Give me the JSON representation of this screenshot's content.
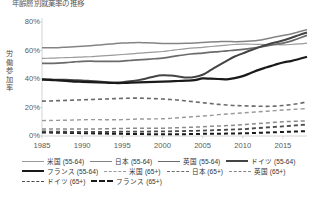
{
  "title": "年齢層別就業率の推移",
  "axes": {
    "ylabel": "労働参加率",
    "yticks": [
      "80%",
      "60%",
      "40%",
      "20%",
      "0%"
    ],
    "xticks": [
      "1985",
      "1990",
      "1995",
      "2000",
      "2005",
      "2010",
      "2015"
    ]
  },
  "legend": [
    {
      "label": "米国 (55-64)",
      "color": "#9a9a9a",
      "width": 1.2,
      "dash": "none"
    },
    {
      "label": "日本 (55-64)",
      "color": "#848484",
      "width": 1.5,
      "dash": "none"
    },
    {
      "label": "英国 (55-64)",
      "color": "#6b6b6b",
      "width": 1.7,
      "dash": "none"
    },
    {
      "label": "ドイツ (55-64)",
      "color": "#444444",
      "width": 2.0,
      "dash": "none"
    },
    {
      "label": "フランス (55-64)",
      "color": "#1a1a1a",
      "width": 2.2,
      "dash": "none"
    },
    {
      "label": "米国 (65+)",
      "color": "#9a9a9a",
      "width": 1.4,
      "dash": "4,3"
    },
    {
      "label": "日本 (65+)",
      "color": "#6b6b6b",
      "width": 1.6,
      "dash": "4,3"
    },
    {
      "label": "英国 (65+)",
      "color": "#8a8a8a",
      "width": 1.5,
      "dash": "4,3"
    },
    {
      "label": "ドイツ (65+)",
      "color": "#4a4a4a",
      "width": 1.8,
      "dash": "4,3"
    },
    {
      "label": "フランス (65+)",
      "color": "#1a1a1a",
      "width": 2.0,
      "dash": "4,3"
    }
  ],
  "chart_data": {
    "type": "line",
    "title": "年齢層別就業率の推移",
    "xlabel": "",
    "ylabel": "労働参加率",
    "ylim": [
      0,
      80
    ],
    "xlim": [
      1985,
      2018
    ],
    "grid": false,
    "legend_position": "bottom",
    "x": [
      1985,
      1986,
      1987,
      1988,
      1989,
      1990,
      1991,
      1992,
      1993,
      1994,
      1995,
      1996,
      1997,
      1998,
      1999,
      2000,
      2001,
      2002,
      2003,
      2004,
      2005,
      2006,
      2007,
      2008,
      2009,
      2010,
      2011,
      2012,
      2013,
      2014,
      2015,
      2016,
      2017,
      2018
    ],
    "series": [
      {
        "name": "日本 (55-64)",
        "color": "#848484",
        "dash": "none",
        "values": [
          62,
          62,
          62,
          62.3,
          62.6,
          63,
          63.4,
          63.8,
          64.3,
          64.8,
          65.2,
          65.4,
          65.6,
          65.4,
          65.2,
          65,
          65,
          65,
          65.1,
          65.3,
          65.6,
          65.9,
          66.2,
          66.4,
          66.2,
          66.3,
          66.6,
          67.2,
          68.3,
          69.4,
          70.5,
          71.6,
          73.2,
          74.6
        ]
      },
      {
        "name": "米国 (55-64)",
        "color": "#9a9a9a",
        "dash": "none",
        "values": [
          54.5,
          54.6,
          54.8,
          55,
          55.2,
          55.4,
          55.6,
          56,
          56.4,
          56.8,
          57.2,
          57.6,
          58.1,
          58.5,
          58.9,
          59.3,
          60,
          60.7,
          61.3,
          61.8,
          62.2,
          62.8,
          63.3,
          63.8,
          64.2,
          64.5,
          64.4,
          64.3,
          64.2,
          64.1,
          64,
          64.2,
          64.6,
          65.2
        ]
      },
      {
        "name": "英国 (55-64)",
        "color": "#6b6b6b",
        "dash": "none",
        "values": [
          51,
          51,
          51.2,
          51.5,
          52,
          52.4,
          52.5,
          52.4,
          52.3,
          52.4,
          52.6,
          53,
          53.4,
          53.8,
          54.2,
          54.6,
          55.5,
          56.4,
          57.2,
          57.8,
          58.2,
          58.8,
          59.2,
          59.8,
          60.2,
          60.8,
          61.5,
          62.4,
          63.3,
          64.2,
          65.2,
          66.6,
          68.6,
          70.6
        ]
      },
      {
        "name": "ドイツ (55-64)",
        "color": "#444444",
        "dash": "none",
        "values": [
          39.8,
          39.6,
          39.5,
          39.4,
          39.2,
          39,
          38.6,
          38.2,
          37.8,
          37.6,
          37.8,
          38.4,
          39.2,
          40.4,
          41.8,
          42.6,
          42.4,
          41.8,
          41,
          41.4,
          43,
          46.2,
          49.6,
          52.8,
          55.8,
          58,
          60.2,
          62.2,
          64,
          65.6,
          67,
          68.8,
          70.8,
          72.6
        ]
      },
      {
        "name": "フランス (55-64)",
        "color": "#1a1a1a",
        "dash": "none",
        "values": [
          39.6,
          39.4,
          39,
          38.6,
          38.2,
          38,
          37.8,
          37.6,
          37.4,
          37.2,
          37.2,
          37.4,
          37.6,
          37.8,
          38,
          38.2,
          38.4,
          38.6,
          38.8,
          39.2,
          40.4,
          40.2,
          40,
          39.8,
          40.6,
          42,
          44.2,
          46.4,
          48.2,
          50,
          51.6,
          52.6,
          54,
          55.6
        ]
      },
      {
        "name": "日本 (65+)",
        "color": "#6b6b6b",
        "dash": "4,3",
        "values": [
          24.5,
          24.6,
          24.8,
          25,
          25.2,
          25.4,
          25.6,
          25.8,
          26,
          26.2,
          26.4,
          26.5,
          26.6,
          26.4,
          26.2,
          26,
          25.6,
          25.2,
          24.6,
          24,
          23.4,
          22.8,
          22.2,
          21.8,
          21.4,
          21.2,
          21,
          20.9,
          20.8,
          21,
          21.4,
          22,
          22.8,
          24
        ]
      },
      {
        "name": "米国 (65+)",
        "color": "#9a9a9a",
        "dash": "4,3",
        "values": [
          10.8,
          10.9,
          11,
          11.1,
          11.2,
          11.4,
          11.5,
          11.5,
          11.4,
          11.4,
          11.5,
          11.7,
          11.9,
          11.9,
          12,
          12.1,
          12.4,
          12.8,
          13.2,
          13.6,
          14,
          14.4,
          15,
          15.4,
          15.8,
          16.2,
          16.6,
          17,
          17.4,
          17.8,
          18.2,
          18.6,
          18.9,
          19.2
        ]
      },
      {
        "name": "英国 (65+)",
        "color": "#8a8a8a",
        "dash": "4,3",
        "values": [
          5,
          5,
          5,
          5,
          5,
          5,
          5,
          5,
          5.1,
          5.2,
          5.3,
          5.4,
          5.4,
          5.4,
          5.5,
          5.5,
          5.6,
          5.8,
          6,
          6.2,
          6.5,
          6.8,
          7,
          7.3,
          7.6,
          8,
          8.4,
          8.8,
          9.2,
          9.6,
          10,
          10.2,
          10.4,
          10.6
        ]
      },
      {
        "name": "フランス (65+)",
        "color": "#1a1a1a",
        "dash": "4,3",
        "values": [
          2.5,
          2.4,
          2.3,
          2.2,
          2.1,
          2,
          1.9,
          1.8,
          1.7,
          1.6,
          1.5,
          1.4,
          1.4,
          1.3,
          1.3,
          1.3,
          1.3,
          1.3,
          1.3,
          1.4,
          1.5,
          1.6,
          1.6,
          1.7,
          1.8,
          1.9,
          2,
          2.2,
          2.4,
          2.6,
          2.8,
          3,
          3.2,
          3.4
        ]
      },
      {
        "name": "ドイツ (65+)",
        "color": "#4a4a4a",
        "dash": "4,3",
        "values": [
          3.2,
          3.1,
          3,
          3,
          2.9,
          2.8,
          2.8,
          2.8,
          2.8,
          2.9,
          3,
          3,
          3.1,
          3.1,
          3.2,
          3.2,
          3.3,
          3.4,
          3.5,
          3.6,
          3.8,
          4,
          4.2,
          4.4,
          4.6,
          4.8,
          5.2,
          5.6,
          6,
          6.4,
          6.8,
          7.2,
          7.6,
          8
        ]
      }
    ]
  }
}
